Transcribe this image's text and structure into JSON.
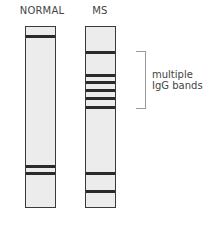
{
  "labels": {
    "normal": "NORMAL",
    "ms": "MS"
  },
  "annotation": {
    "line1": "multiple",
    "line2": "IgG bands"
  },
  "strips": {
    "normal": {
      "bands_y": [
        9,
        139,
        146
      ]
    },
    "ms": {
      "bands_y": [
        25,
        48,
        55,
        63,
        71,
        80,
        146,
        164
      ]
    }
  },
  "colors": {
    "strip_fill": "#ececec",
    "band": "#2a2a2a",
    "border": "#3a3a3a",
    "bracket": "#999999"
  }
}
